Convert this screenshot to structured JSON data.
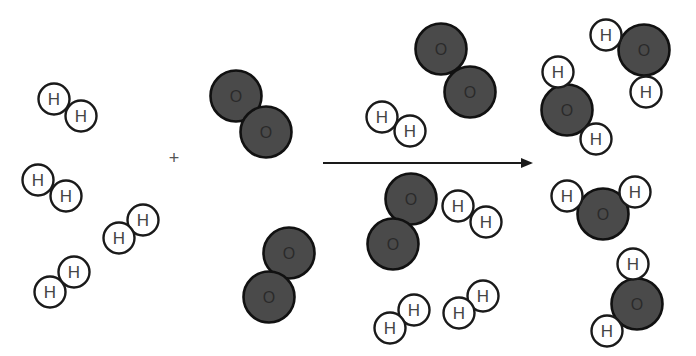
{
  "diagram": {
    "plus_symbol": "+",
    "plus_position": {
      "x": 174,
      "y": 158
    },
    "arrow": {
      "x1": 323,
      "y1": 163,
      "x2": 531,
      "y2": 163,
      "color": "#1a1a1a"
    },
    "colors": {
      "hydrogen_fill": "#ffffff",
      "oxygen_fill": "#4a4a4a",
      "stroke": "#1a1a1a"
    },
    "hydrogen_label": "H",
    "oxygen_label": "O",
    "reactants": {
      "h2_molecules": [
        {
          "atoms": [
            {
              "x": 54,
              "y": 99
            },
            {
              "x": 81,
              "y": 116
            }
          ]
        },
        {
          "atoms": [
            {
              "x": 38,
              "y": 180
            },
            {
              "x": 66,
              "y": 196
            }
          ]
        },
        {
          "atoms": [
            {
              "x": 143,
              "y": 220
            },
            {
              "x": 119,
              "y": 238
            }
          ]
        },
        {
          "atoms": [
            {
              "x": 74,
              "y": 272
            },
            {
              "x": 50,
              "y": 292
            }
          ]
        }
      ],
      "o2_molecules": [
        {
          "atoms": [
            {
              "x": 236,
              "y": 96
            },
            {
              "x": 266,
              "y": 132
            }
          ]
        },
        {
          "atoms": [
            {
              "x": 289,
              "y": 253
            },
            {
              "x": 269,
              "y": 297
            }
          ]
        }
      ]
    },
    "products": {
      "remaining_h2": [
        {
          "atoms": [
            {
              "x": 382,
              "y": 117
            },
            {
              "x": 410,
              "y": 131
            }
          ]
        },
        {
          "atoms": [
            {
              "x": 458,
              "y": 206
            },
            {
              "x": 486,
              "y": 222
            }
          ]
        },
        {
          "atoms": [
            {
              "x": 414,
              "y": 310
            },
            {
              "x": 390,
              "y": 328
            }
          ]
        },
        {
          "atoms": [
            {
              "x": 483,
              "y": 296
            },
            {
              "x": 459,
              "y": 313
            }
          ]
        }
      ],
      "remaining_o2": [
        {
          "atoms": [
            {
              "x": 441,
              "y": 49
            },
            {
              "x": 470,
              "y": 92
            }
          ]
        },
        {
          "atoms": [
            {
              "x": 411,
              "y": 199
            },
            {
              "x": 393,
              "y": 244
            }
          ]
        }
      ],
      "h2o_molecules": [
        {
          "o": {
            "x": 644,
            "y": 50
          },
          "h": [
            {
              "x": 606,
              "y": 35
            },
            {
              "x": 646,
              "y": 92
            }
          ]
        },
        {
          "o": {
            "x": 567,
            "y": 110
          },
          "h": [
            {
              "x": 558,
              "y": 72
            },
            {
              "x": 596,
              "y": 139
            }
          ]
        },
        {
          "o": {
            "x": 603,
            "y": 214
          },
          "h": [
            {
              "x": 567,
              "y": 196
            },
            {
              "x": 635,
              "y": 192
            }
          ]
        },
        {
          "o": {
            "x": 637,
            "y": 304
          },
          "h": [
            {
              "x": 633,
              "y": 264
            },
            {
              "x": 607,
              "y": 331
            }
          ]
        }
      ]
    },
    "radii": {
      "hydrogen": 15.5,
      "oxygen": 25.5
    }
  }
}
